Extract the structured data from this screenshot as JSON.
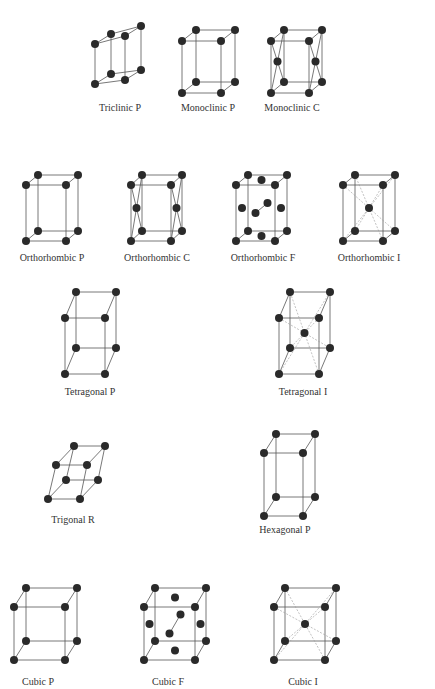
{
  "figure": {
    "colors": {
      "background": "#ffffff",
      "edge": "#555555",
      "dashed": "#999999",
      "atom": "#2a2a2a",
      "label": "#333333"
    }
  },
  "lattices": [
    {
      "id": "triclinic-p",
      "label": "Triclinic P",
      "label_pos": [
        120,
        108
      ],
      "front": [
        [
          95,
          84
        ],
        [
          95,
          44
        ],
        [
          125,
          36
        ],
        [
          125,
          80
        ]
      ],
      "shift": [
        16,
        -10
      ],
      "extra": "",
      "fill": "none"
    },
    {
      "id": "monoclinic-p",
      "label": "Monoclinic P",
      "label_pos": [
        208,
        108
      ],
      "front": [
        [
          182,
          93
        ],
        [
          182,
          41
        ],
        [
          221,
          41
        ],
        [
          221,
          93
        ]
      ],
      "shift": [
        14,
        -11
      ],
      "extra": "",
      "fill": "none"
    },
    {
      "id": "monoclinic-c",
      "label": "Monoclinic C",
      "label_pos": [
        292,
        108
      ],
      "front": [
        [
          271,
          93
        ],
        [
          271,
          41
        ],
        [
          309,
          41
        ],
        [
          309,
          93
        ]
      ],
      "shift": [
        13,
        -11
      ],
      "extra": "C",
      "fill": "none"
    },
    {
      "id": "orthorhombic-p",
      "label": "Orthorhombic P",
      "label_pos": [
        52,
        258
      ],
      "front": [
        [
          26,
          241
        ],
        [
          26,
          185
        ],
        [
          66,
          185
        ],
        [
          66,
          241
        ]
      ],
      "shift": [
        12,
        -10
      ],
      "extra": "",
      "fill": "none"
    },
    {
      "id": "orthorhombic-c",
      "label": "Orthorhombic C",
      "label_pos": [
        157,
        258
      ],
      "front": [
        [
          131,
          241
        ],
        [
          131,
          185
        ],
        [
          171,
          185
        ],
        [
          171,
          241
        ]
      ],
      "shift": [
        11,
        -10
      ],
      "extra": "C",
      "fill": "none"
    },
    {
      "id": "orthorhombic-f",
      "label": "Orthorhombic F",
      "label_pos": [
        263,
        258
      ],
      "front": [
        [
          236,
          241
        ],
        [
          236,
          185
        ],
        [
          275,
          185
        ],
        [
          275,
          241
        ]
      ],
      "shift": [
        12,
        -10
      ],
      "extra": "F",
      "fill": "none"
    },
    {
      "id": "orthorhombic-i",
      "label": "Orthorhombic I",
      "label_pos": [
        369,
        258
      ],
      "front": [
        [
          343,
          241
        ],
        [
          343,
          185
        ],
        [
          383,
          185
        ],
        [
          383,
          241
        ]
      ],
      "shift": [
        12,
        -10
      ],
      "extra": "I",
      "fill": "none"
    },
    {
      "id": "tetragonal-p",
      "label": "Tetragonal P",
      "label_pos": [
        90,
        392
      ],
      "front": [
        [
          65,
          374
        ],
        [
          65,
          318
        ],
        [
          105,
          318
        ],
        [
          105,
          374
        ]
      ],
      "shift": [
        11,
        -26
      ],
      "extra": "",
      "fill": "none"
    },
    {
      "id": "tetragonal-i",
      "label": "Tetragonal I",
      "label_pos": [
        303,
        392
      ],
      "front": [
        [
          279,
          374
        ],
        [
          279,
          318
        ],
        [
          319,
          318
        ],
        [
          319,
          374
        ]
      ],
      "shift": [
        11,
        -26
      ],
      "extra": "I",
      "fill": "none"
    },
    {
      "id": "trigonal-r",
      "label": "Trigonal R",
      "label_pos": [
        73,
        520
      ],
      "front": [
        [
          48,
          499
        ],
        [
          56,
          465
        ],
        [
          87,
          465
        ],
        [
          80,
          499
        ]
      ],
      "shift": [
        18,
        -19
      ],
      "extra": "",
      "fill": "none"
    },
    {
      "id": "hexagonal-p",
      "label": "Hexagonal P",
      "label_pos": [
        285,
        530
      ],
      "front": [
        [
          264,
          516
        ],
        [
          264,
          453
        ],
        [
          303,
          453
        ],
        [
          303,
          516
        ]
      ],
      "shift": [
        12,
        -19
      ],
      "extra": "",
      "fill": "none"
    },
    {
      "id": "cubic-p",
      "label": "Cubic P",
      "label_pos": [
        38,
        682
      ],
      "front": [
        [
          14,
          660
        ],
        [
          14,
          607
        ],
        [
          65,
          607
        ],
        [
          65,
          660
        ]
      ],
      "shift": [
        12,
        -19
      ],
      "extra": "",
      "fill": "none"
    },
    {
      "id": "cubic-f",
      "label": "Cubic F",
      "label_pos": [
        168,
        682
      ],
      "front": [
        [
          144,
          660
        ],
        [
          144,
          607
        ],
        [
          195,
          607
        ],
        [
          195,
          660
        ]
      ],
      "shift": [
        11,
        -19
      ],
      "extra": "F",
      "fill": "none"
    },
    {
      "id": "cubic-i",
      "label": "Cubic I",
      "label_pos": [
        303,
        682
      ],
      "front": [
        [
          274,
          660
        ],
        [
          274,
          607
        ],
        [
          325,
          607
        ],
        [
          325,
          660
        ]
      ],
      "shift": [
        11,
        -19
      ],
      "extra": "I",
      "fill": "none"
    }
  ]
}
